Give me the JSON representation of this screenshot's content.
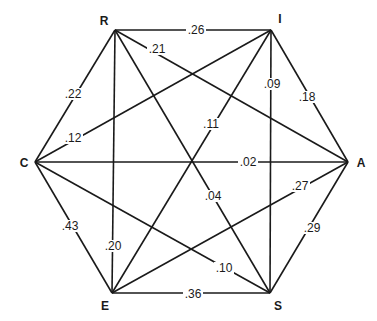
{
  "diagram": {
    "type": "hexagonal-correlation-network",
    "corner_text": "",
    "nodes": [
      {
        "id": "R",
        "label": "R",
        "x": 115,
        "y": 30,
        "lx": 104,
        "ly": 25
      },
      {
        "id": "I",
        "label": "I",
        "x": 271,
        "y": 30,
        "lx": 280,
        "ly": 23
      },
      {
        "id": "C",
        "label": "C",
        "x": 35,
        "y": 162,
        "lx": 24,
        "ly": 167
      },
      {
        "id": "A",
        "label": "A",
        "x": 348,
        "y": 162,
        "lx": 361,
        "ly": 167
      },
      {
        "id": "E",
        "label": "E",
        "x": 112,
        "y": 293,
        "lx": 105,
        "ly": 310
      },
      {
        "id": "S",
        "label": "S",
        "x": 270,
        "y": 293,
        "lx": 278,
        "ly": 310
      }
    ],
    "edges": [
      {
        "from": "R",
        "to": "I",
        "value": ".26",
        "lx": 196,
        "ly": 30
      },
      {
        "from": "R",
        "to": "A",
        "value": ".21",
        "lx": 157,
        "ly": 49
      },
      {
        "from": "R",
        "to": "C",
        "value": ".22",
        "lx": 73,
        "ly": 94
      },
      {
        "from": "R",
        "to": "E",
        "value": ".20",
        "lx": 113,
        "ly": 246
      },
      {
        "from": "R",
        "to": "S",
        "value": ".04",
        "lx": 213,
        "ly": 196
      },
      {
        "from": "I",
        "to": "A",
        "value": ".18",
        "lx": 307,
        "ly": 97
      },
      {
        "from": "I",
        "to": "S",
        "value": ".09",
        "lx": 272,
        "ly": 84
      },
      {
        "from": "I",
        "to": "C",
        "value": ".12",
        "lx": 73,
        "ly": 138
      },
      {
        "from": "I",
        "to": "E",
        "value": ".11",
        "lx": 211,
        "ly": 124
      },
      {
        "from": "C",
        "to": "A",
        "value": ".02",
        "lx": 248,
        "ly": 162
      },
      {
        "from": "C",
        "to": "E",
        "value": ".43",
        "lx": 70,
        "ly": 226
      },
      {
        "from": "C",
        "to": "S",
        "value": ".10",
        "lx": 224,
        "ly": 268
      },
      {
        "from": "A",
        "to": "E",
        "value": ".27",
        "lx": 300,
        "ly": 186
      },
      {
        "from": "A",
        "to": "S",
        "value": ".29",
        "lx": 312,
        "ly": 228
      },
      {
        "from": "E",
        "to": "S",
        "value": ".36",
        "lx": 193,
        "ly": 294
      }
    ]
  },
  "colors": {
    "line": "#1a1a1a",
    "background": "#ffffff"
  }
}
